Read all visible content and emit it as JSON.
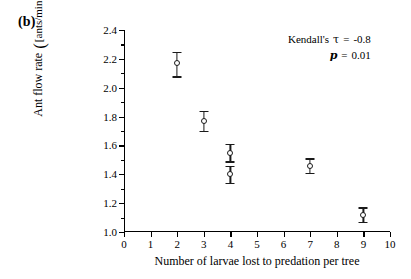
{
  "panel": {
    "label": "(b)"
  },
  "chart_data": {
    "type": "scatter",
    "title": "",
    "xlabel": "Number of larvae lost to predation per tree",
    "ylabel_prefix": "Ant flow rate",
    "ylabel_unit": "[ants/min]",
    "ylabel_exponent": "½",
    "xlim": [
      0,
      10
    ],
    "ylim": [
      1.0,
      2.4
    ],
    "xticks": [
      0,
      1,
      2,
      3,
      4,
      5,
      6,
      7,
      8,
      9,
      10
    ],
    "xticklabels": [
      "0",
      "1",
      "2",
      "3",
      "4",
      "5",
      "6",
      "7",
      "8",
      "9",
      "10"
    ],
    "yticks": [
      1.0,
      1.2,
      1.4,
      1.6,
      1.8,
      2.0,
      2.2,
      2.4
    ],
    "yticklabels": [
      "1.0",
      "1.2",
      "1.4",
      "1.6",
      "1.8",
      "2.0",
      "2.2",
      "2.4"
    ],
    "yminorticks": [
      1.1,
      1.3,
      1.5,
      1.7,
      1.9,
      2.1,
      2.3
    ],
    "grid": false,
    "legend": null,
    "marker": "open-circle",
    "errorbars": true,
    "points": [
      {
        "x": 2,
        "y": 2.17,
        "yerr_low": 0.09,
        "yerr_high": 0.08
      },
      {
        "x": 3,
        "y": 1.77,
        "yerr_low": 0.07,
        "yerr_high": 0.07
      },
      {
        "x": 4,
        "y": 1.55,
        "yerr_low": 0.06,
        "yerr_high": 0.06
      },
      {
        "x": 4,
        "y": 1.4,
        "yerr_low": 0.06,
        "yerr_high": 0.06
      },
      {
        "x": 7,
        "y": 1.46,
        "yerr_low": 0.05,
        "yerr_high": 0.05
      },
      {
        "x": 9,
        "y": 1.12,
        "yerr_low": 0.05,
        "yerr_high": 0.05
      }
    ],
    "annotations": {
      "test_name": "Kendall's",
      "tau_symbol": "τ",
      "tau_eq": "=",
      "tau_value": "-0.8",
      "p_symbol": "p",
      "p_eq": "=",
      "p_value": "0.01"
    }
  }
}
